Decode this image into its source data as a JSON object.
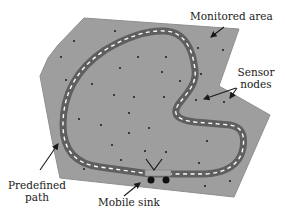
{
  "diagram": {
    "labels": {
      "monitored_area": "Monitored area",
      "sensor_nodes_line1": "Sensor",
      "sensor_nodes_line2": "nodes",
      "predefined_path_line1": "Predefined",
      "predefined_path_line2": "path",
      "mobile_sink": "Mobile sink"
    },
    "colors": {
      "area_fill": "#9e9e9e",
      "area_stroke": "#8a8a8a",
      "path_fill": "#666666",
      "path_dash": "#ffffff",
      "node": "#1a1a1a",
      "arrow": "#1a1a1a",
      "text": "#1a1a1a"
    },
    "elements": {
      "monitored_area": "gray polygon region",
      "sensor_nodes": "small black dots scattered in area",
      "predefined_path": "closed dark road loop with white dashed center line",
      "mobile_sink": "vehicle with two wheels and V-antenna on path"
    }
  }
}
